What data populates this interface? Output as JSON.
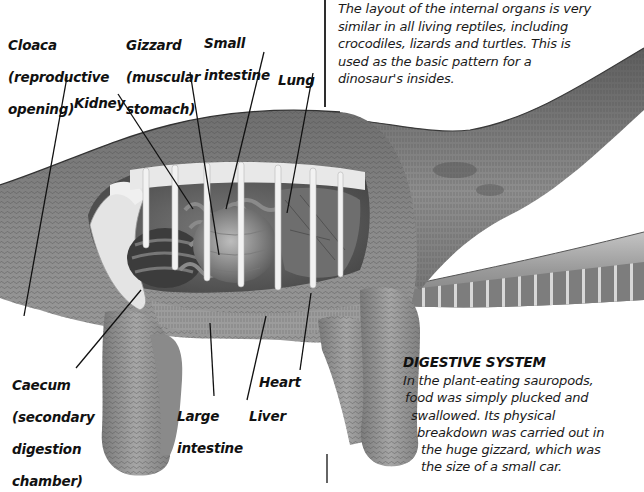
{
  "intro": {
    "lines": [
      "The layout of the internal organs is very",
      "similar in all living reptiles, including",
      "crocodiles, lizards and turtles. This is",
      "used as the basic pattern for a",
      "dinosaur's insides."
    ]
  },
  "labels": {
    "cloaca": [
      "Cloaca",
      "(reproductive",
      "opening)"
    ],
    "gizzard": [
      "Gizzard",
      "(muscular",
      "stomach)"
    ],
    "small_intestine": [
      "Small",
      "intestine"
    ],
    "lung": [
      "Lung"
    ],
    "kidney": [
      "Kidney"
    ],
    "caecum": [
      "Caecum",
      "(secondary",
      "digestion",
      "chamber)"
    ],
    "large_intestine": [
      "Large",
      "intestine"
    ],
    "liver": [
      "Liver"
    ],
    "heart": [
      "Heart"
    ]
  },
  "digestive": {
    "title": "DIGESTIVE SYSTEM",
    "lines": [
      "In the plant-eating sauropods,",
      "food was simply plucked and",
      "swallowed. Its physical",
      "breakdown was carried out in",
      "the huge gizzard, which was",
      "the size of a small car."
    ]
  },
  "colors": {
    "background": "#ffffff",
    "text": "#111111",
    "skin_dark": "#5a5a5a",
    "skin_mid": "#8c8c8c",
    "skin_light": "#bdbdbd",
    "bone": "#eeeeee",
    "leader_line": "#111111"
  }
}
